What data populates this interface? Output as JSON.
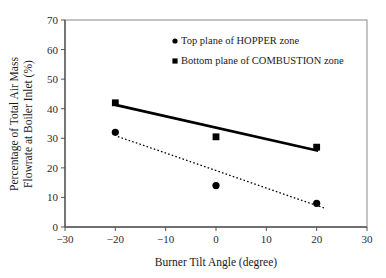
{
  "chart_data": {
    "type": "scatter",
    "title": "",
    "xlabel": "Burner Tilt Angle (degree)",
    "ylabel_line1": "Percentage of Total Air Mass",
    "ylabel_line2": "Flowrate at Boiler Inlet (%)",
    "xlim": [
      -30,
      30
    ],
    "ylim": [
      0,
      70
    ],
    "xticks": [
      -30,
      -20,
      -10,
      0,
      10,
      20,
      30
    ],
    "xtick_labels": [
      "−30",
      "−20",
      "−10",
      "0",
      "10",
      "20",
      "30"
    ],
    "yticks": [
      0,
      10,
      20,
      30,
      40,
      50,
      60,
      70
    ],
    "ytick_labels": [
      "0",
      "10",
      "20",
      "30",
      "40",
      "50",
      "60",
      "70"
    ],
    "grid": false,
    "legend_position": "upper-center",
    "x": [
      -20,
      0,
      20
    ],
    "series": [
      {
        "name": "Top plane of HOPPER zone",
        "marker": "circle",
        "color": "#000000",
        "values": [
          32,
          14,
          8
        ],
        "trendline": {
          "style": "dotted",
          "x0": -19.5,
          "y0": 30.6,
          "x1": 21.5,
          "y1": 6.4
        }
      },
      {
        "name": "Bottom plane of COMBUSTION zone",
        "marker": "square",
        "color": "#000000",
        "values": [
          42,
          30.5,
          27
        ],
        "trendline": {
          "style": "solid",
          "x0": -20,
          "y0": 41.3,
          "x1": 20.3,
          "y1": 25.8
        }
      }
    ],
    "legend": [
      {
        "marker": "circle",
        "label": "Top plane of HOPPER zone"
      },
      {
        "marker": "square",
        "label": "Bottom plane of COMBUSTION zone"
      }
    ]
  }
}
